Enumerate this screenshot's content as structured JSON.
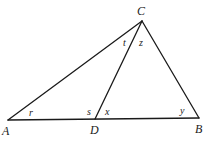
{
  "figure": {
    "points": {
      "A": {
        "x": 8,
        "y": 120
      },
      "D": {
        "x": 95,
        "y": 119
      },
      "B": {
        "x": 199,
        "y": 118
      },
      "C": {
        "x": 142,
        "y": 21
      }
    },
    "segments": [
      {
        "from": "A",
        "to": "B"
      },
      {
        "from": "A",
        "to": "C"
      },
      {
        "from": "C",
        "to": "B"
      },
      {
        "from": "C",
        "to": "D"
      }
    ],
    "vertex_labels": {
      "A": "A",
      "B": "B",
      "C": "C",
      "D": "D"
    },
    "angle_labels": {
      "r": "r",
      "s": "s",
      "t": "t",
      "x": "x",
      "y": "y",
      "z": "z"
    },
    "line_color": "#1a1a1a"
  }
}
